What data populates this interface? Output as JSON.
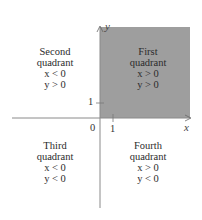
{
  "diagram": {
    "type": "coordinate-plane-quadrants",
    "axes": {
      "x_label": "x",
      "y_label": "y",
      "origin_label": "0",
      "x_tick_label": "1",
      "y_tick_label": "1"
    },
    "shaded_region": "First quadrant",
    "colors": {
      "shade": "#9e9e9e",
      "axis": "#8a8a8a",
      "text": "#2b2b2b"
    },
    "quadrants": [
      {
        "id": "first",
        "name": "First",
        "word": "quadrant",
        "x_cond": "x > 0",
        "y_cond": "y > 0"
      },
      {
        "id": "second",
        "name": "Second",
        "word": "quadrant",
        "x_cond": "x < 0",
        "y_cond": "y > 0"
      },
      {
        "id": "third",
        "name": "Third",
        "word": "quadrant",
        "x_cond": "x < 0",
        "y_cond": "y < 0"
      },
      {
        "id": "fourth",
        "name": "Fourth",
        "word": "quadrant",
        "x_cond": "x > 0",
        "y_cond": "y < 0"
      }
    ]
  }
}
